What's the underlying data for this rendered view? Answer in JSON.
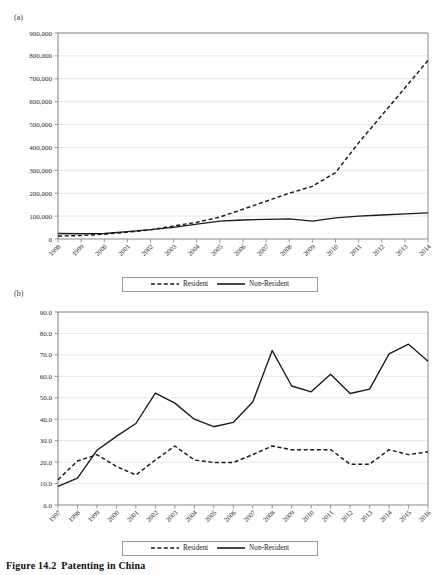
{
  "running_head": {
    "title": "",
    "page": ""
  },
  "figure": {
    "caption_number": "Figure 14.2",
    "caption_text": "Patenting in China"
  },
  "panels": [
    {
      "id": "a",
      "label": "(a)"
    },
    {
      "id": "b",
      "label": "(b)"
    }
  ],
  "legend": {
    "resident_label": "Resident",
    "nonresident_label": "Non-Resident"
  },
  "colors": {
    "line": "#1a1a1a",
    "axis": "#8a8a8a",
    "grid": "#e3e3e6",
    "text": "#2b2b2b"
  },
  "chart_data": [
    {
      "panel": "a",
      "type": "line",
      "title": "",
      "xlabel": "",
      "ylabel": "",
      "grid": true,
      "legend_position": "bottom",
      "ylim": [
        0,
        900000
      ],
      "yticks": [
        0,
        100000,
        200000,
        300000,
        400000,
        500000,
        600000,
        700000,
        800000,
        900000
      ],
      "ytick_labels": [
        "0",
        "100,000",
        "200,000",
        "300,000",
        "400,000",
        "500,000",
        "600,000",
        "700,000",
        "800,000",
        "900,000"
      ],
      "categories": [
        "1998",
        "1999",
        "2000",
        "2001",
        "2002",
        "2003",
        "2004",
        "2005",
        "2006",
        "2007",
        "2008",
        "2009",
        "2010",
        "2011",
        "2012",
        "2013",
        "2014"
      ],
      "series": [
        {
          "name": "Resident",
          "style": "dashed",
          "values": [
            13000,
            15000,
            21000,
            30000,
            40000,
            57000,
            73000,
            96000,
            130000,
            165000,
            200000,
            230000,
            290000,
            420000,
            540000,
            660000,
            780000
          ]
        },
        {
          "name": "Non-Resident",
          "style": "solid",
          "values": [
            24000,
            23000,
            24000,
            32000,
            41000,
            51000,
            65000,
            78000,
            83000,
            86000,
            88000,
            78000,
            92000,
            100000,
            105000,
            110000,
            114000
          ]
        }
      ]
    },
    {
      "panel": "b",
      "type": "line",
      "title": "",
      "xlabel": "",
      "ylabel": "",
      "grid": true,
      "legend_position": "bottom",
      "ylim": [
        0,
        90
      ],
      "yticks": [
        0,
        10,
        20,
        30,
        40,
        50,
        60,
        70,
        80,
        90
      ],
      "ytick_labels": [
        "0.0",
        "10.0",
        "20.0",
        "30.0",
        "40.0",
        "50.0",
        "60.0",
        "70.0",
        "80.0",
        "90.0"
      ],
      "categories": [
        "1997",
        "1998",
        "1999",
        "2000",
        "2001",
        "2002",
        "2003",
        "2004",
        "2005",
        "2006",
        "2007",
        "2008",
        "2009",
        "2010",
        "2011",
        "2012",
        "2013",
        "2014",
        "2015",
        "2016"
      ],
      "series": [
        {
          "name": "Resident",
          "style": "dashed",
          "values": [
            11.8,
            20.5,
            23.5,
            18.0,
            14.0,
            21.0,
            27.5,
            21.0,
            19.8,
            19.8,
            23.5,
            27.5,
            25.8,
            25.8,
            25.8,
            19.0,
            19.0,
            25.8,
            23.5,
            24.8
          ]
        },
        {
          "name": "Non-Resident",
          "style": "solid",
          "values": [
            8.7,
            12.5,
            25.5,
            32.0,
            38.0,
            52.2,
            47.5,
            40.0,
            36.5,
            38.5,
            48.0,
            72.0,
            55.5,
            52.8,
            61.0,
            52.0,
            54.0,
            70.5,
            75.0,
            67.0
          ]
        }
      ]
    }
  ]
}
